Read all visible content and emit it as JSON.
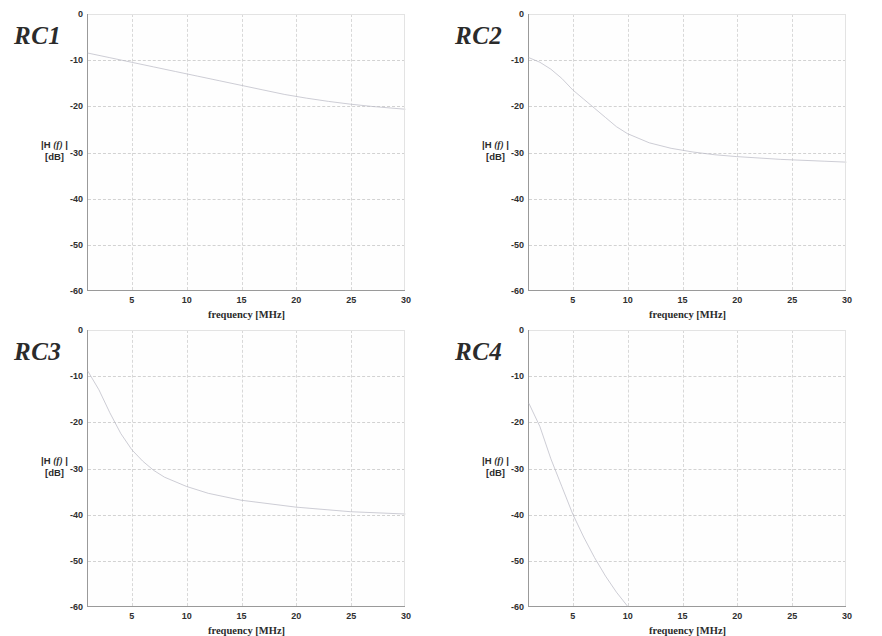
{
  "figure": {
    "caption_none": "",
    "panel_count": 4
  },
  "axis": {
    "ylabel_main": "|H",
    "ylabel_arg": "(f)",
    "ylabel_close": "|",
    "ylabel_unit": "[dB]",
    "xlabel": "frequency  [MHz]",
    "yticks": [
      "0",
      "-10",
      "-20",
      "-30",
      "-40",
      "-50",
      "-60"
    ],
    "ytick_values": [
      0,
      -10,
      -20,
      -30,
      -40,
      -50,
      -60
    ],
    "xticks": [
      "5",
      "10",
      "15",
      "20",
      "25",
      "30"
    ],
    "xtick_values": [
      5,
      10,
      15,
      20,
      25,
      30
    ],
    "xlim": [
      1,
      30
    ],
    "ylim": [
      -60,
      0
    ]
  },
  "colors": {
    "background": "#ffffff",
    "axis_line": "#9a9a9a",
    "gridline": "#d2d2d2",
    "trace": "#b9b9c4",
    "text": "#2b2b2b"
  },
  "panels": [
    {
      "title": "RC1"
    },
    {
      "title": "RC2"
    },
    {
      "title": "RC3"
    },
    {
      "title": "RC4"
    }
  ],
  "chart_data": [
    {
      "type": "line",
      "title": "RC1",
      "xlabel": "frequency  [MHz]",
      "ylabel": "|H (f)| [dB]",
      "xlim": [
        1,
        30
      ],
      "ylim": [
        -60,
        0
      ],
      "grid": true,
      "legend": "none",
      "x": [
        1,
        3,
        5,
        7,
        9,
        11,
        13,
        15,
        17,
        19,
        21,
        23,
        25,
        27,
        29,
        30
      ],
      "series": [
        {
          "name": "RC1 magnitude response",
          "values": [
            -8.5,
            -9.5,
            -10.5,
            -11.5,
            -12.5,
            -13.5,
            -14.5,
            -15.5,
            -16.5,
            -17.5,
            -18.3,
            -19.0,
            -19.6,
            -20.1,
            -20.5,
            -20.7
          ]
        }
      ]
    },
    {
      "type": "line",
      "title": "RC2",
      "xlabel": "frequency  [MHz]",
      "ylabel": "|H (f)| [dB]",
      "xlim": [
        1,
        30
      ],
      "ylim": [
        -60,
        0
      ],
      "grid": true,
      "legend": "none",
      "x": [
        1,
        2,
        3,
        4,
        5,
        6,
        7,
        8,
        9,
        10,
        12,
        14,
        16,
        18,
        20,
        24,
        28,
        30
      ],
      "series": [
        {
          "name": "RC2 magnitude response",
          "values": [
            -9.5,
            -10.5,
            -12.0,
            -14.0,
            -16.5,
            -18.5,
            -20.5,
            -22.5,
            -24.5,
            -26.0,
            -28.0,
            -29.2,
            -30.0,
            -30.6,
            -31.0,
            -31.6,
            -32.0,
            -32.2
          ]
        }
      ]
    },
    {
      "type": "line",
      "title": "RC3",
      "xlabel": "frequency  [MHz]",
      "ylabel": "|H (f)| [dB]",
      "xlim": [
        1,
        30
      ],
      "ylim": [
        -60,
        0
      ],
      "grid": true,
      "legend": "none",
      "x": [
        1,
        2,
        3,
        4,
        5,
        6,
        7,
        8,
        10,
        12,
        15,
        20,
        25,
        30
      ],
      "series": [
        {
          "name": "RC3 magnitude response",
          "values": [
            -9.0,
            -13.0,
            -18.0,
            -22.5,
            -26.0,
            -28.5,
            -30.5,
            -32.0,
            -34.0,
            -35.5,
            -37.0,
            -38.5,
            -39.5,
            -40.0
          ]
        }
      ]
    },
    {
      "type": "line",
      "title": "RC4",
      "xlabel": "frequency  [MHz]",
      "ylabel": "|H (f)| [dB]",
      "xlim": [
        1,
        30
      ],
      "ylim": [
        -60,
        0
      ],
      "grid": true,
      "legend": "none",
      "x": [
        1,
        2,
        3,
        4,
        5,
        6,
        7,
        8,
        9,
        10
      ],
      "series": [
        {
          "name": "RC4 magnitude response",
          "values": [
            -16.0,
            -21.0,
            -28.0,
            -34.0,
            -40.0,
            -45.0,
            -49.5,
            -53.5,
            -57.0,
            -60.0
          ]
        }
      ]
    }
  ]
}
